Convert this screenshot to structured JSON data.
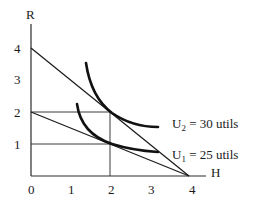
{
  "diagram": {
    "type": "indifference-curve-budget-diagram",
    "y_axis_label": "R",
    "x_axis_label": "H",
    "y_ticks": [
      "1",
      "2",
      "3",
      "4"
    ],
    "x_ticks": [
      "0",
      "1",
      "2",
      "3",
      "4"
    ],
    "budget_lines": [
      {
        "name": "budget-line-high",
        "from": [
          0,
          4
        ],
        "to": [
          4,
          0
        ]
      },
      {
        "name": "budget-line-low",
        "from": [
          0,
          2
        ],
        "to": [
          4,
          0
        ]
      }
    ],
    "guide_lines": [
      {
        "name": "guide-r2",
        "from": [
          0,
          2
        ],
        "to": [
          2,
          2
        ]
      },
      {
        "name": "guide-r1",
        "from": [
          0,
          1
        ],
        "to": [
          2,
          1
        ]
      },
      {
        "name": "guide-h2",
        "from": [
          2,
          0
        ],
        "to": [
          2,
          2
        ]
      }
    ],
    "curves": [
      {
        "id": "U2",
        "label_main": "U",
        "label_sub": "2",
        "label_rest": " = 30 utils",
        "tangent_point": [
          2,
          2
        ]
      },
      {
        "id": "U1",
        "label_main": "U",
        "label_sub": "1",
        "label_rest": " = 25 utils",
        "tangent_point": [
          2,
          1
        ]
      }
    ],
    "colors": {
      "ink": "#111111",
      "background": "#ffffff"
    }
  }
}
